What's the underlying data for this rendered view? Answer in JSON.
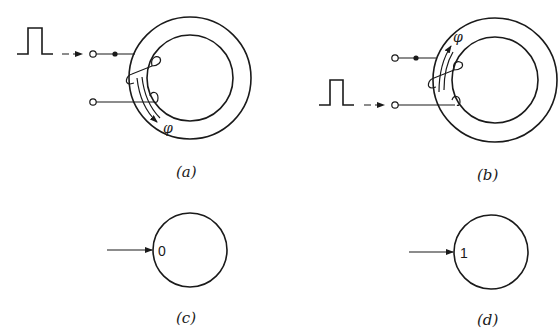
{
  "figure": {
    "panels": [
      {
        "id": "a",
        "label": "(a)",
        "flux_symbol": "φ",
        "flux_direction": "clockwise (downward on left side)",
        "pulse_input": "lower-left via top terminal"
      },
      {
        "id": "b",
        "label": "(b)",
        "flux_symbol": "φ",
        "flux_direction": "counter-clockwise (upward on left side)",
        "pulse_input": "via bottom terminal"
      },
      {
        "id": "c",
        "label": "(c)",
        "state": "0"
      },
      {
        "id": "d",
        "label": "(d)",
        "state": "1"
      }
    ]
  }
}
